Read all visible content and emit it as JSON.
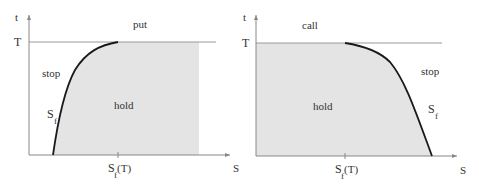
{
  "colors": {
    "background": "#ffffff",
    "hold_region": "#e4e4e4",
    "axis": "#888888",
    "boundary_curve": "#1a1a1a",
    "text": "#333333"
  },
  "panels": [
    {
      "id": "put",
      "title": "put",
      "axes": {
        "x_label": "S",
        "y_label": "t",
        "y_tick_label": "T",
        "x_tick_label_main": "S",
        "x_tick_label_sub": "f",
        "x_tick_label_suffix": "(T)"
      },
      "regions": {
        "stop": "stop",
        "hold": "hold"
      },
      "curve_label": {
        "main": "S",
        "sub": "f"
      }
    },
    {
      "id": "call",
      "title": "call",
      "axes": {
        "x_label": "S",
        "y_label": "t",
        "y_tick_label": "T",
        "x_tick_label_main": "S",
        "x_tick_label_sub": "f",
        "x_tick_label_suffix": "(T)"
      },
      "regions": {
        "stop": "stop",
        "hold": "hold"
      },
      "curve_label": {
        "main": "S",
        "sub": "f"
      }
    }
  ]
}
